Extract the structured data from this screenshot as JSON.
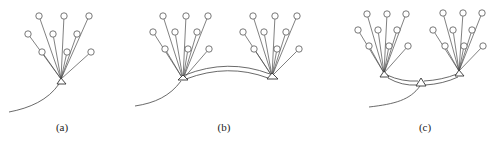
{
  "panels": [
    {
      "id": "a",
      "label": "(a)",
      "label_pos": [
        62,
        131
      ],
      "clusters": [
        {
          "apex": [
            61,
            79
          ],
          "triangle": [
            [
              61,
              78
            ],
            [
              57,
              84
            ],
            [
              66,
              84
            ]
          ],
          "nodes": [
            [
              39,
              16
            ],
            [
              64,
              16
            ],
            [
              89,
              16
            ],
            [
              28,
              34
            ],
            [
              53,
              34
            ],
            [
              77,
              34
            ],
            [
              42,
              52
            ],
            [
              67,
              52
            ],
            [
              91,
              52
            ]
          ]
        }
      ],
      "curves": [
        {
          "d": "M59,84 C48,100 30,108 9,112"
        }
      ],
      "arcs": []
    },
    {
      "id": "b",
      "label": "(b)",
      "label_pos": [
        224,
        131
      ],
      "clusters": [
        {
          "apex": [
            183,
            79
          ],
          "triangle": [
            [
              183,
              75
            ],
            [
              178,
              80
            ],
            [
              188,
              80
            ]
          ],
          "nodes": [
            [
              163,
              16
            ],
            [
              186,
              16
            ],
            [
              208,
              16
            ],
            [
              153,
              32
            ],
            [
              175,
              32
            ],
            [
              197,
              32
            ],
            [
              165,
              49
            ],
            [
              188,
              49
            ],
            [
              209,
              49
            ]
          ]
        },
        {
          "apex": [
            272,
            76
          ],
          "triangle": [
            [
              272,
              73
            ],
            [
              267,
              79
            ],
            [
              278,
              79
            ]
          ],
          "nodes": [
            [
              253,
              16
            ],
            [
              275,
              16
            ],
            [
              297,
              16
            ],
            [
              243,
              32
            ],
            [
              264,
              32
            ],
            [
              286,
              32
            ],
            [
              254,
              49
            ],
            [
              277,
              49
            ],
            [
              299,
              49
            ]
          ]
        }
      ],
      "curves": [
        {
          "d": "M181,81 C170,96 155,103 135,106"
        }
      ],
      "arcs": [
        {
          "d": "M185,75 Q228,58 270,74"
        },
        {
          "d": "M186,79 Q228,63 268,78"
        }
      ]
    },
    {
      "id": "c",
      "label": "(c)",
      "label_pos": [
        425,
        131
      ],
      "clusters": [
        {
          "apex": [
            384,
            73
          ],
          "triangle": [
            [
              384,
              71
            ],
            [
              380,
              77
            ],
            [
              389,
              77
            ]
          ],
          "nodes": [
            [
              367,
              14
            ],
            [
              387,
              14
            ],
            [
              406,
              14
            ],
            [
              358,
              30
            ],
            [
              378,
              30
            ],
            [
              397,
              30
            ],
            [
              369,
              46
            ],
            [
              389,
              46
            ],
            [
              408,
              46
            ]
          ]
        },
        {
          "apex": [
            459,
            71
          ],
          "triangle": [
            [
              459,
              70
            ],
            [
              455,
              76
            ],
            [
              464,
              76
            ]
          ],
          "nodes": [
            [
              443,
              13
            ],
            [
              463,
              13
            ],
            [
              482,
              13
            ],
            [
              433,
              30
            ],
            [
              453,
              30
            ],
            [
              472,
              30
            ],
            [
              445,
              46
            ],
            [
              464,
              46
            ],
            [
              483,
              46
            ]
          ]
        },
        {
          "apex": null,
          "triangle": [
            [
              421,
              78
            ],
            [
              416,
              86
            ],
            [
              426,
              86
            ]
          ],
          "nodes": []
        }
      ],
      "curves": [
        {
          "d": "M420,86 C410,100 395,104 369,107"
        }
      ],
      "arcs": [
        {
          "d": "M387,75 Q402,82 418,81"
        },
        {
          "d": "M388,78 Q402,86 417,85"
        },
        {
          "d": "M424,81 Q442,80 457,74"
        },
        {
          "d": "M425,85 Q443,84 458,77"
        }
      ]
    }
  ],
  "style": {
    "node_radius": 3.2,
    "line_color": "#4a4a4a",
    "background": "#ffffff"
  }
}
